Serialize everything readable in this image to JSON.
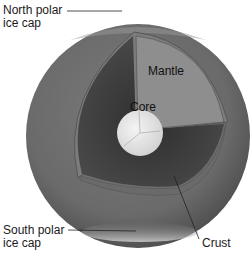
{
  "diagram": {
    "labels": {
      "north_polar_ice_cap": "North polar\nice cap",
      "south_polar_ice_cap": "South polar\nice cap",
      "mantle": "Mantle",
      "core": "Core",
      "crust": "Crust"
    },
    "colors": {
      "surface": "#6e6e6e",
      "mantle_face_light": "#8c8c8c",
      "mantle_face_dark": "#3c3c3c",
      "core": "#e6e6e6",
      "leader_line": "#222222"
    }
  }
}
